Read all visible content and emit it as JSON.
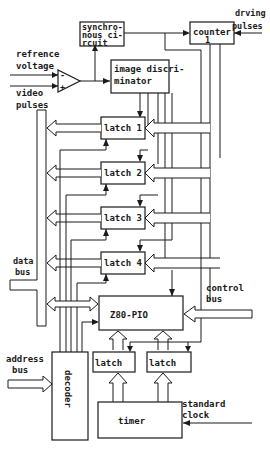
{
  "diagram": {
    "blocks": {
      "synchronous_circuit": [
        "synchro-",
        "nous ci-",
        "rcuit"
      ],
      "counter": "counter",
      "counter_sub": "1",
      "image_discriminator": [
        "image discri-",
        "minator"
      ],
      "latch1": "latch 1",
      "latch2": "latch 2",
      "latch3": "latch 3",
      "latch4": "latch 4",
      "z80_pio": "Z80-PIO",
      "latch_left": "latch",
      "latch_right": "latch",
      "decoder": "decoder",
      "timer": "timer"
    },
    "labels": {
      "driving_pulses": [
        "drving",
        "pulses"
      ],
      "reference_voltage": [
        "refrence",
        "voltage"
      ],
      "video_pulses": [
        "video",
        "pulses"
      ],
      "data_bus": [
        "data",
        "bus"
      ],
      "control_bus": [
        "control",
        "bus"
      ],
      "address_bus": [
        "address",
        "bus"
      ],
      "standard_clock": [
        "standard",
        "clock"
      ],
      "comparator_minus": "-",
      "comparator_plus": "+"
    }
  }
}
